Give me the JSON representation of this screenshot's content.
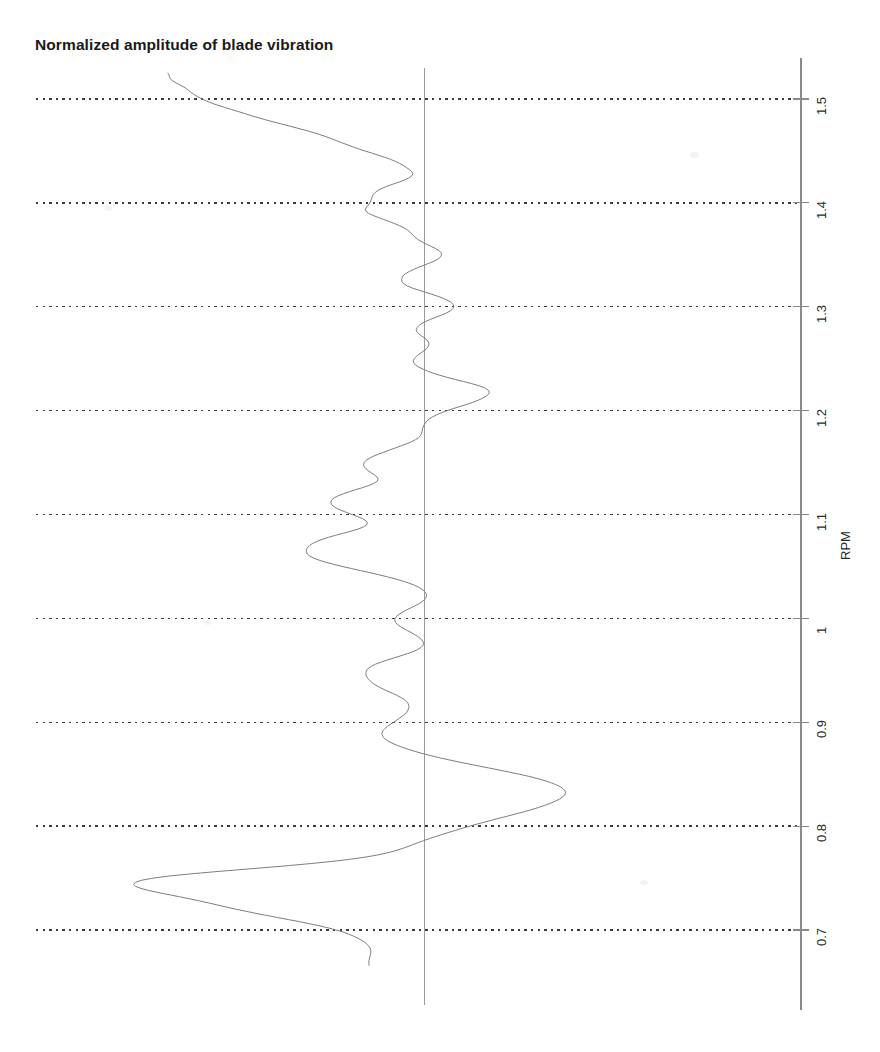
{
  "figure": {
    "title": "Normalized amplitude of blade vibration",
    "background_color": "#ffffff",
    "width": 880,
    "height": 1052
  },
  "axis": {
    "title": "RPM",
    "line_color": "#8a8a8a",
    "tick_labels": [
      "0.7",
      "0.8",
      "0.9",
      "1",
      "1.1",
      "1.2",
      "1.3",
      "1.4",
      "1.5"
    ],
    "orientation": "vertical-right",
    "label_rotation_deg": -90
  },
  "gridlines": {
    "style": "dotted",
    "color": "#3c3c3c",
    "values": [
      0.7,
      0.8,
      0.9,
      1.0,
      1.1,
      1.2,
      1.3,
      1.4,
      1.5
    ]
  },
  "reference_line": {
    "label": "zero-amplitude",
    "value": 0,
    "color": "#9a9a9a"
  },
  "trace": {
    "color": "#7d7d7d",
    "width": 1.0
  },
  "chart_data": {
    "type": "line",
    "title": "Normalized amplitude of blade vibration",
    "orientation": "horizontal-amplitude-vertical-rpm",
    "xlabel": "Normalized amplitude",
    "ylabel": "RPM",
    "ylim": [
      0.648,
      1.554
    ],
    "xlim": [
      -2.2,
      1.9
    ],
    "grid": true,
    "legend": null,
    "ytick_values": [
      0.7,
      0.8,
      0.9,
      1.0,
      1.1,
      1.2,
      1.3,
      1.4,
      1.5
    ],
    "ytick_labels": [
      "0.7",
      "0.8",
      "0.9",
      "1",
      "1.1",
      "1.2",
      "1.3",
      "1.4",
      "1.5"
    ],
    "reference_x": 0,
    "series": [
      {
        "name": "blade vibration amplitude",
        "color": "#7d7d7d",
        "rpm": [
          1.525,
          1.5245,
          1.5235,
          1.522,
          1.5205,
          1.519,
          1.5175,
          1.516,
          1.5145,
          1.513,
          1.5115,
          1.51,
          1.5085,
          1.507,
          1.5055,
          1.504,
          1.5025,
          1.501,
          1.4995,
          1.498,
          1.496,
          1.494,
          1.492,
          1.49,
          1.488,
          1.486,
          1.484,
          1.482,
          1.48,
          1.478,
          1.476,
          1.474,
          1.472,
          1.47,
          1.468,
          1.466,
          1.464,
          1.462,
          1.46,
          1.458,
          1.456,
          1.454,
          1.452,
          1.45,
          1.448,
          1.446,
          1.444,
          1.442,
          1.44,
          1.438,
          1.436,
          1.434,
          1.432,
          1.43,
          1.428,
          1.426,
          1.424,
          1.422,
          1.42,
          1.418,
          1.416,
          1.414,
          1.412,
          1.41,
          1.408,
          1.406,
          1.404,
          1.402,
          1.4,
          1.398,
          1.396,
          1.394,
          1.392,
          1.39,
          1.388,
          1.386,
          1.384,
          1.382,
          1.38,
          1.378,
          1.376,
          1.374,
          1.372,
          1.37,
          1.368,
          1.366,
          1.364,
          1.362,
          1.36,
          1.358,
          1.356,
          1.354,
          1.352,
          1.35,
          1.348,
          1.346,
          1.344,
          1.342,
          1.34,
          1.338,
          1.336,
          1.334,
          1.332,
          1.33,
          1.328,
          1.326,
          1.324,
          1.322,
          1.32,
          1.318,
          1.316,
          1.314,
          1.312,
          1.31,
          1.308,
          1.306,
          1.304,
          1.302,
          1.3,
          1.298,
          1.296,
          1.294,
          1.292,
          1.29,
          1.288,
          1.286,
          1.284,
          1.282,
          1.28,
          1.278,
          1.276,
          1.274,
          1.272,
          1.27,
          1.268,
          1.266,
          1.264,
          1.262,
          1.26,
          1.258,
          1.256,
          1.254,
          1.252,
          1.25,
          1.248,
          1.246,
          1.244,
          1.242,
          1.24,
          1.238,
          1.236,
          1.234,
          1.232,
          1.23,
          1.228,
          1.226,
          1.224,
          1.222,
          1.22,
          1.218,
          1.216,
          1.214,
          1.212,
          1.21,
          1.208,
          1.206,
          1.204,
          1.202,
          1.2,
          1.198,
          1.196,
          1.194,
          1.192,
          1.19,
          1.188,
          1.186,
          1.184,
          1.182,
          1.18,
          1.178,
          1.176,
          1.174,
          1.172,
          1.17,
          1.168,
          1.166,
          1.164,
          1.162,
          1.16,
          1.158,
          1.156,
          1.154,
          1.152,
          1.15,
          1.148,
          1.146,
          1.144,
          1.142,
          1.14,
          1.138,
          1.136,
          1.134,
          1.132,
          1.13,
          1.128,
          1.126,
          1.124,
          1.122,
          1.12,
          1.118,
          1.116,
          1.114,
          1.112,
          1.11,
          1.108,
          1.106,
          1.104,
          1.102,
          1.1,
          1.098,
          1.096,
          1.094,
          1.092,
          1.09,
          1.088,
          1.086,
          1.084,
          1.082,
          1.08,
          1.078,
          1.076,
          1.074,
          1.072,
          1.07,
          1.068,
          1.066,
          1.064,
          1.062,
          1.06,
          1.058,
          1.056,
          1.054,
          1.052,
          1.05,
          1.048,
          1.046,
          1.044,
          1.042,
          1.04,
          1.038,
          1.036,
          1.034,
          1.032,
          1.03,
          1.028,
          1.026,
          1.024,
          1.022,
          1.02,
          1.018,
          1.016,
          1.014,
          1.012,
          1.01,
          1.008,
          1.006,
          1.004,
          1.002,
          1.0,
          0.998,
          0.996,
          0.994,
          0.992,
          0.99,
          0.988,
          0.986,
          0.984,
          0.982,
          0.98,
          0.978,
          0.976,
          0.974,
          0.972,
          0.97,
          0.968,
          0.966,
          0.964,
          0.962,
          0.96,
          0.958,
          0.956,
          0.954,
          0.952,
          0.95,
          0.948,
          0.946,
          0.944,
          0.942,
          0.94,
          0.938,
          0.936,
          0.934,
          0.932,
          0.93,
          0.928,
          0.926,
          0.924,
          0.922,
          0.92,
          0.918,
          0.916,
          0.914,
          0.912,
          0.91,
          0.908,
          0.906,
          0.904,
          0.902,
          0.9,
          0.898,
          0.896,
          0.894,
          0.892,
          0.89,
          0.888,
          0.886,
          0.884,
          0.882,
          0.88,
          0.878,
          0.876,
          0.874,
          0.872,
          0.87,
          0.868,
          0.866,
          0.864,
          0.862,
          0.86,
          0.858,
          0.856,
          0.854,
          0.852,
          0.85,
          0.848,
          0.846,
          0.844,
          0.842,
          0.84,
          0.838,
          0.836,
          0.834,
          0.832,
          0.83,
          0.828,
          0.826,
          0.824,
          0.822,
          0.82,
          0.818,
          0.816,
          0.814,
          0.812,
          0.81,
          0.808,
          0.806,
          0.804,
          0.802,
          0.8,
          0.798,
          0.796,
          0.794,
          0.792,
          0.79,
          0.788,
          0.786,
          0.784,
          0.782,
          0.78,
          0.778,
          0.776,
          0.774,
          0.772,
          0.77,
          0.768,
          0.766,
          0.764,
          0.762,
          0.76,
          0.758,
          0.756,
          0.754,
          0.752,
          0.75,
          0.748,
          0.746,
          0.744,
          0.742,
          0.74,
          0.738,
          0.736,
          0.734,
          0.732,
          0.73,
          0.728,
          0.726,
          0.724,
          0.722,
          0.72,
          0.718,
          0.716,
          0.714,
          0.712,
          0.71,
          0.708,
          0.706,
          0.704,
          0.702,
          0.7,
          0.698,
          0.696,
          0.694,
          0.692,
          0.69,
          0.688,
          0.686,
          0.684,
          0.682,
          0.68,
          0.678,
          0.676,
          0.674,
          0.672,
          0.67,
          0.668,
          0.666,
          0.664,
          0.662,
          0.66,
          0.658,
          0.656,
          0.654,
          0.652,
          0.6505
        ],
        "amplitude": [
          -1.05,
          -1.048,
          -1.046,
          -1.044,
          -1.042,
          -1.038,
          -1.03,
          -1.02,
          -1.008,
          -0.996,
          -0.984,
          -0.974,
          -0.966,
          -0.958,
          -0.95,
          -0.94,
          -0.93,
          -0.918,
          -0.905,
          -0.89,
          -0.87,
          -0.845,
          -0.818,
          -0.79,
          -0.762,
          -0.735,
          -0.708,
          -0.68,
          -0.65,
          -0.618,
          -0.585,
          -0.552,
          -0.52,
          -0.488,
          -0.458,
          -0.43,
          -0.405,
          -0.382,
          -0.36,
          -0.338,
          -0.315,
          -0.292,
          -0.268,
          -0.242,
          -0.215,
          -0.188,
          -0.162,
          -0.138,
          -0.118,
          -0.1,
          -0.085,
          -0.072,
          -0.06,
          -0.05,
          -0.045,
          -0.05,
          -0.062,
          -0.08,
          -0.102,
          -0.128,
          -0.152,
          -0.172,
          -0.188,
          -0.2,
          -0.208,
          -0.212,
          -0.215,
          -0.218,
          -0.222,
          -0.228,
          -0.235,
          -0.24,
          -0.238,
          -0.228,
          -0.21,
          -0.188,
          -0.165,
          -0.142,
          -0.12,
          -0.1,
          -0.082,
          -0.068,
          -0.058,
          -0.05,
          -0.042,
          -0.032,
          -0.02,
          -0.005,
          0.012,
          0.03,
          0.048,
          0.062,
          0.07,
          0.072,
          0.068,
          0.058,
          0.042,
          0.022,
          0.0,
          -0.022,
          -0.042,
          -0.06,
          -0.075,
          -0.085,
          -0.09,
          -0.092,
          -0.09,
          -0.082,
          -0.068,
          -0.048,
          -0.022,
          0.005,
          0.032,
          0.058,
          0.08,
          0.098,
          0.112,
          0.12,
          0.122,
          0.118,
          0.108,
          0.092,
          0.072,
          0.05,
          0.028,
          0.008,
          -0.008,
          -0.02,
          -0.028,
          -0.032,
          -0.03,
          -0.022,
          -0.01,
          0.002,
          0.012,
          0.018,
          0.02,
          0.018,
          0.012,
          0.002,
          -0.01,
          -0.022,
          -0.032,
          -0.04,
          -0.044,
          -0.042,
          -0.035,
          -0.022,
          -0.005,
          0.015,
          0.038,
          0.065,
          0.095,
          0.128,
          0.162,
          0.195,
          0.225,
          0.248,
          0.262,
          0.268,
          0.265,
          0.255,
          0.24,
          0.222,
          0.2,
          0.175,
          0.148,
          0.12,
          0.095,
          0.072,
          0.052,
          0.035,
          0.022,
          0.012,
          0.005,
          0.0,
          -0.004,
          -0.006,
          -0.008,
          -0.01,
          -0.014,
          -0.022,
          -0.035,
          -0.052,
          -0.072,
          -0.095,
          -0.118,
          -0.142,
          -0.165,
          -0.188,
          -0.208,
          -0.225,
          -0.238,
          -0.245,
          -0.248,
          -0.245,
          -0.238,
          -0.228,
          -0.215,
          -0.202,
          -0.192,
          -0.188,
          -0.192,
          -0.205,
          -0.225,
          -0.25,
          -0.278,
          -0.305,
          -0.33,
          -0.352,
          -0.368,
          -0.378,
          -0.382,
          -0.38,
          -0.372,
          -0.358,
          -0.34,
          -0.318,
          -0.295,
          -0.272,
          -0.252,
          -0.238,
          -0.232,
          -0.235,
          -0.248,
          -0.27,
          -0.298,
          -0.33,
          -0.362,
          -0.392,
          -0.418,
          -0.44,
          -0.458,
          -0.47,
          -0.478,
          -0.482,
          -0.482,
          -0.478,
          -0.468,
          -0.452,
          -0.43,
          -0.402,
          -0.37,
          -0.335,
          -0.298,
          -0.26,
          -0.222,
          -0.185,
          -0.15,
          -0.118,
          -0.088,
          -0.062,
          -0.04,
          -0.022,
          -0.008,
          0.002,
          0.008,
          0.01,
          0.008,
          0.002,
          -0.008,
          -0.022,
          -0.038,
          -0.055,
          -0.072,
          -0.088,
          -0.102,
          -0.112,
          -0.118,
          -0.12,
          -0.116,
          -0.108,
          -0.096,
          -0.082,
          -0.066,
          -0.05,
          -0.035,
          -0.022,
          -0.012,
          -0.005,
          -0.002,
          -0.004,
          -0.012,
          -0.026,
          -0.045,
          -0.068,
          -0.095,
          -0.122,
          -0.15,
          -0.175,
          -0.198,
          -0.215,
          -0.228,
          -0.235,
          -0.238,
          -0.238,
          -0.235,
          -0.23,
          -0.222,
          -0.212,
          -0.2,
          -0.185,
          -0.168,
          -0.15,
          -0.13,
          -0.112,
          -0.096,
          -0.082,
          -0.072,
          -0.065,
          -0.062,
          -0.062,
          -0.065,
          -0.07,
          -0.078,
          -0.088,
          -0.1,
          -0.112,
          -0.125,
          -0.138,
          -0.15,
          -0.16,
          -0.168,
          -0.172,
          -0.172,
          -0.168,
          -0.16,
          -0.148,
          -0.132,
          -0.112,
          -0.09,
          -0.065,
          -0.038,
          -0.008,
          0.025,
          0.06,
          0.098,
          0.138,
          0.18,
          0.222,
          0.265,
          0.308,
          0.35,
          0.39,
          0.428,
          0.462,
          0.492,
          0.518,
          0.54,
          0.558,
          0.57,
          0.578,
          0.58,
          0.576,
          0.568,
          0.555,
          0.538,
          0.518,
          0.495,
          0.47,
          0.442,
          0.412,
          0.38,
          0.348,
          0.315,
          0.282,
          0.25,
          0.218,
          0.188,
          0.158,
          0.13,
          0.102,
          0.075,
          0.048,
          0.022,
          -0.002,
          -0.025,
          -0.048,
          -0.07,
          -0.095,
          -0.122,
          -0.155,
          -0.195,
          -0.245,
          -0.305,
          -0.378,
          -0.462,
          -0.555,
          -0.655,
          -0.76,
          -0.862,
          -0.958,
          -1.042,
          -1.108,
          -1.155,
          -1.182,
          -1.19,
          -1.182,
          -1.16,
          -1.128,
          -1.088,
          -1.045,
          -1.002,
          -0.96,
          -0.92,
          -0.882,
          -0.845,
          -0.808,
          -0.77,
          -0.73,
          -0.688,
          -0.645,
          -0.6,
          -0.555,
          -0.51,
          -0.468,
          -0.428,
          -0.392,
          -0.36,
          -0.332,
          -0.308,
          -0.288,
          -0.27,
          -0.255,
          -0.242,
          -0.232,
          -0.225,
          -0.22,
          -0.218,
          -0.218,
          -0.22,
          -0.222,
          -0.224,
          -0.226,
          -0.226,
          -0.225
        ]
      }
    ]
  }
}
